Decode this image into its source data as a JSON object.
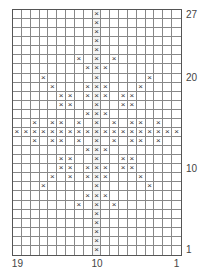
{
  "chart_data": {
    "type": "table",
    "title": "",
    "columns": 19,
    "rows": 27,
    "column_numbering": "right-to-left (1 at right, 19 at left)",
    "row_numbering": "bottom-to-top (1 at bottom, 27 at top)",
    "center_column": 10,
    "row_labels": [
      {
        "row": 27,
        "text": "27"
      },
      {
        "row": 20,
        "text": "20"
      },
      {
        "row": 10,
        "text": "10"
      },
      {
        "row": 1,
        "text": "1"
      }
    ],
    "column_labels": [
      {
        "col": 19,
        "text": "19"
      },
      {
        "col": 10,
        "text": "10"
      },
      {
        "col": 1,
        "text": "1"
      }
    ],
    "symbol": "×",
    "marked": {
      "27": [
        10
      ],
      "26": [
        10
      ],
      "25": [
        10
      ],
      "24": [
        10
      ],
      "23": [
        10
      ],
      "22": [
        12,
        10,
        8
      ],
      "21": [
        11,
        10,
        9
      ],
      "20": [
        16,
        10,
        4
      ],
      "19": [
        15,
        11,
        10,
        9,
        5
      ],
      "18": [
        14,
        13,
        11,
        10,
        9,
        7,
        6
      ],
      "17": [
        14,
        13,
        10,
        7,
        6
      ],
      "16": [
        11,
        10,
        9
      ],
      "15": [
        17,
        15,
        14,
        12,
        10,
        8,
        6,
        5,
        3
      ],
      "14": [
        19,
        18,
        17,
        16,
        15,
        14,
        13,
        12,
        11,
        10,
        9,
        8,
        7,
        6,
        5,
        4,
        3,
        2,
        1
      ],
      "13": [
        17,
        15,
        14,
        12,
        10,
        8,
        6,
        5,
        3
      ],
      "12": [
        11,
        10,
        9
      ],
      "11": [
        14,
        13,
        10,
        7,
        6
      ],
      "10": [
        14,
        13,
        11,
        10,
        9,
        7,
        6
      ],
      "9": [
        15,
        13,
        11,
        10,
        9,
        5
      ],
      "8": [
        16,
        10,
        4
      ],
      "7": [
        11,
        10,
        9
      ],
      "6": [
        12,
        10,
        8
      ],
      "5": [
        10
      ],
      "4": [
        10
      ],
      "3": [
        10
      ],
      "2": [
        10
      ],
      "1": [
        10
      ]
    }
  }
}
